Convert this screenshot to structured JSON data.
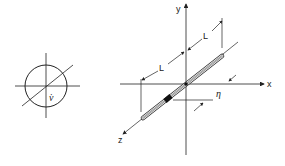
{
  "figure": {
    "left_view": {
      "symbol_label": "v̇",
      "description": "cross-section circle with axes and diagonal"
    },
    "right_view": {
      "axes": {
        "x_label": "x",
        "y_label": "y",
        "z_label": "z"
      },
      "dimensions": {
        "length_label_1": "L",
        "length_label_2": "L",
        "offset_label": "η"
      },
      "description": "rod of length 2L along diagonal through origin, with offset η marker"
    },
    "colors": {
      "line": "#222222",
      "background": "#ffffff"
    }
  }
}
